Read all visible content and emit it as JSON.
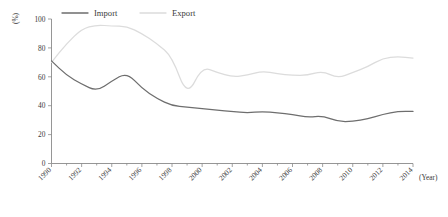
{
  "chart_data": {
    "type": "line",
    "title": "",
    "subtitle": "",
    "xlabel": "(Year)",
    "ylabel": "(%)",
    "xlim": [
      1990,
      2014
    ],
    "ylim": [
      0,
      100
    ],
    "grid": false,
    "legend_position": "top-center",
    "x": [
      1990,
      1991,
      1992,
      1993,
      1994,
      1995,
      1996,
      1997,
      1998,
      1999,
      2000,
      2001,
      2002,
      2003,
      2004,
      2005,
      2006,
      2007,
      2008,
      2009,
      2010,
      2011,
      2012,
      2013,
      2014
    ],
    "xticks": [
      "1990",
      "1992",
      "1994",
      "1996",
      "1998",
      "2000",
      "2002",
      "2004",
      "2006",
      "2008",
      "2010",
      "2012",
      "2014"
    ],
    "yticks": [
      "0",
      "20",
      "40",
      "60",
      "80",
      "100"
    ],
    "series": [
      {
        "name": "Import",
        "color": "#6e6e6e",
        "values": [
          71,
          61,
          55,
          50,
          57,
          63,
          52,
          45,
          40,
          39,
          38,
          37,
          36,
          35,
          36,
          35,
          34,
          32,
          33,
          29,
          29,
          31,
          34,
          36,
          36
        ]
      },
      {
        "name": "Export",
        "color": "#dcdcdc",
        "values": [
          70,
          83,
          93,
          96,
          95,
          95,
          90,
          83,
          74,
          46,
          67,
          63,
          60,
          61,
          64,
          62,
          61,
          61,
          64,
          59,
          63,
          67,
          73,
          74,
          73
        ]
      }
    ]
  },
  "legend": {
    "items": [
      {
        "label": "Import",
        "color": "#6e6e6e"
      },
      {
        "label": "Export",
        "color": "#dcdcdc"
      }
    ]
  },
  "axes": {
    "y_axis_title": "(%)",
    "x_axis_title": "(Year)"
  }
}
